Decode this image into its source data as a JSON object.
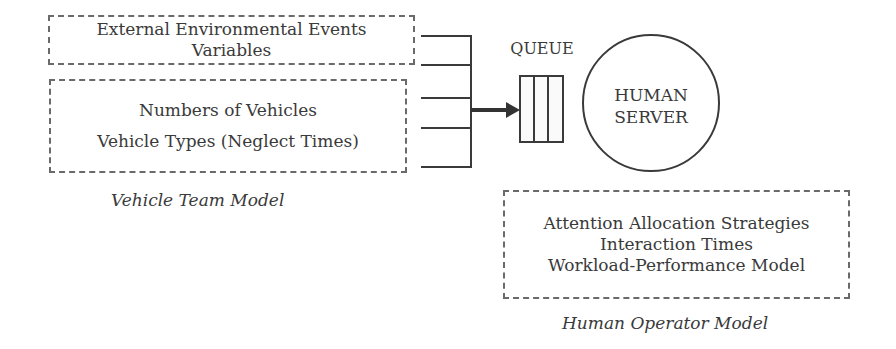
{
  "vehicle_team": {
    "env_box": {
      "line1": "External Environmental Events",
      "line2": "Variables"
    },
    "vehicles_box": {
      "line1": "Numbers of Vehicles",
      "line2": "Vehicle Types (Neglect Times)"
    },
    "caption": "Vehicle Team Model"
  },
  "queue": {
    "label": "QUEUE",
    "slots": 3
  },
  "server": {
    "line1": "HUMAN",
    "line2": "SERVER"
  },
  "human_operator": {
    "box": {
      "line1": "Attention Allocation Strategies",
      "line2": "Interaction Times",
      "line3": "Workload-Performance Model"
    },
    "caption": "Human Operator Model"
  }
}
